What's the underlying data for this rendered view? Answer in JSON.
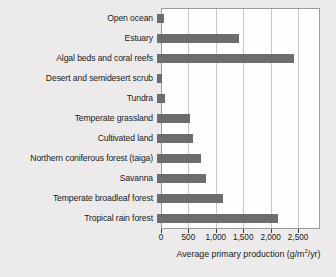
{
  "chart_data": {
    "type": "bar",
    "orientation": "horizontal",
    "title": "",
    "xlabel": "Average primary production (g/m2/yr)",
    "xlabel_parts": {
      "before": "Average primary production (g/m",
      "sup": "2",
      "after": "/yr)"
    },
    "ylabel": "",
    "xlim": [
      0,
      2900
    ],
    "xticks": [
      0,
      500,
      1000,
      1500,
      2000,
      2500
    ],
    "xticklabels": [
      "0",
      "500",
      "1,000",
      "1,500",
      "2,000",
      "2,500"
    ],
    "grid": "vertical",
    "legend": "none",
    "bar_color": "#6d6d6d",
    "categories": [
      "Open ocean",
      "Estuary",
      "Algal beds and coral reefs",
      "Desert and semidesert scrub",
      "Tundra",
      "Temperate grassland",
      "Cultivated land",
      "Northern coniferous forest (taiga)",
      "Savanna",
      "Temperate broadleaf forest",
      "Tropical rain forest"
    ],
    "values": [
      125,
      1500,
      2500,
      90,
      140,
      600,
      650,
      800,
      900,
      1200,
      2200
    ]
  }
}
